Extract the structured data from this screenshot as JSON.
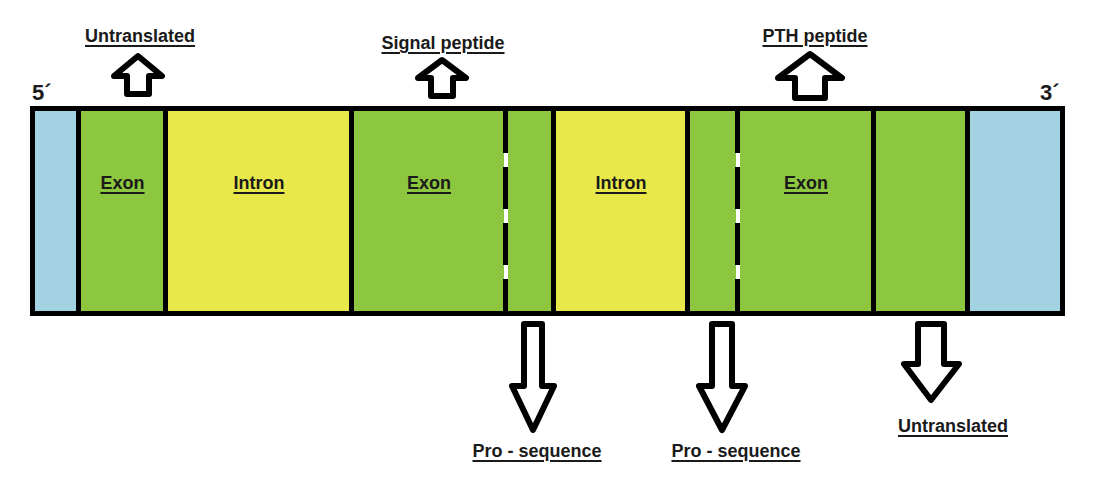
{
  "ends": {
    "five_prime": "5´",
    "three_prime": "3´"
  },
  "colors": {
    "utr_blue": "#a3d2e2",
    "exon_green": "#8dc63f",
    "intron_yellow": "#e9e84a",
    "outline": "#000000"
  },
  "segments": [
    {
      "type": "utr",
      "label": ""
    },
    {
      "type": "exon",
      "label": "Exon"
    },
    {
      "type": "intron",
      "label": "Intron"
    },
    {
      "type": "exon",
      "label": "Exon"
    },
    {
      "type": "exon-part",
      "label": ""
    },
    {
      "type": "intron",
      "label": "Intron"
    },
    {
      "type": "exon-part",
      "label": ""
    },
    {
      "type": "exon",
      "label": "Exon"
    },
    {
      "type": "exon-untranslated",
      "label": ""
    },
    {
      "type": "utr",
      "label": ""
    }
  ],
  "annotations_top": [
    {
      "label": "Untranslated",
      "direction": "up"
    },
    {
      "label": "Signal peptide",
      "direction": "up"
    },
    {
      "label": "PTH peptide",
      "direction": "up"
    }
  ],
  "annotations_bottom": [
    {
      "label": "Pro - sequence",
      "direction": "down"
    },
    {
      "label": "Pro - sequence",
      "direction": "down"
    },
    {
      "label": "Untranslated",
      "direction": "down"
    }
  ]
}
